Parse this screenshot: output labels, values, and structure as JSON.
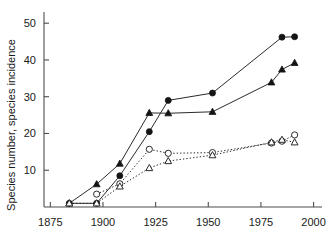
{
  "chart_data": {
    "type": "line",
    "title": "",
    "xlabel": "",
    "ylabel": "Species number, species incidence",
    "xlim": [
      1872,
      2004
    ],
    "ylim": [
      0,
      52.5
    ],
    "grid": false,
    "legend": "none",
    "xticks": [
      1875,
      1900,
      1925,
      1950,
      1975,
      2000
    ],
    "xtick_labels": [
      "1875",
      "1900",
      "1925",
      "1950",
      "1975",
      "2000"
    ],
    "yticks": [
      10,
      20,
      30,
      40,
      50
    ],
    "ytick_labels": [
      "10",
      "20",
      "30",
      "40",
      "50"
    ],
    "series": [
      {
        "name": "species-number-filled-circles",
        "marker": "filled-circle",
        "line": "solid",
        "color": "#141414",
        "x": [
          1884,
          1897,
          1908,
          1922,
          1931,
          1952,
          1985,
          1991
        ],
        "values": [
          1.0,
          1.0,
          8.5,
          20.5,
          29.0,
          31.0,
          46.2,
          46.3
        ]
      },
      {
        "name": "species-number-filled-triangles",
        "marker": "filled-triangle",
        "line": "solid",
        "color": "#141414",
        "x": [
          1884,
          1897,
          1908,
          1922,
          1931,
          1952,
          1980,
          1985,
          1991
        ],
        "values": [
          1.0,
          6.2,
          11.8,
          25.6,
          25.5,
          25.9,
          33.9,
          37.4,
          39.2
        ]
      },
      {
        "name": "species-incidence-open-circles",
        "marker": "open-circle",
        "line": "dotted",
        "color": "#2b2b2b",
        "x": [
          1897,
          1908,
          1922,
          1931,
          1952,
          1980,
          1985,
          1991
        ],
        "values": [
          3.5,
          6.3,
          15.7,
          14.6,
          14.8,
          17.4,
          17.9,
          19.6
        ]
      },
      {
        "name": "species-incidence-open-triangles",
        "marker": "open-triangle",
        "line": "dotted",
        "color": "#2b2b2b",
        "x": [
          1884,
          1897,
          1908,
          1922,
          1931,
          1952,
          1980,
          1985,
          1991
        ],
        "values": [
          1.0,
          1.0,
          5.6,
          10.6,
          12.5,
          14.1,
          17.6,
          18.3,
          17.6
        ]
      }
    ]
  }
}
